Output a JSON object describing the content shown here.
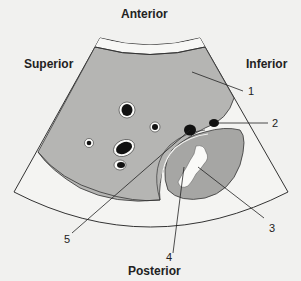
{
  "orientation": {
    "top": "Anterior",
    "bottom": "Posterior",
    "left": "Superior",
    "right": "Inferior"
  },
  "callouts": [
    {
      "number": "1"
    },
    {
      "number": "2"
    },
    {
      "number": "3"
    },
    {
      "number": "4"
    },
    {
      "number": "5"
    }
  ],
  "colors": {
    "background": "#f1f1ef",
    "liver": "#b5b5b3",
    "kidney": "#a6a6a4",
    "vessel": "#111111",
    "outline": "#333333"
  }
}
